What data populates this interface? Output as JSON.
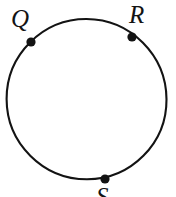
{
  "figure": {
    "type": "geometry-diagram",
    "canvas": {
      "width": 176,
      "height": 197
    },
    "background_color": "#ffffff",
    "stroke_color": "#131313",
    "point_fill_color": "#131313",
    "circle": {
      "name": "circle-outline",
      "center_x": 86.5,
      "center_y": 99,
      "radius": 80,
      "stroke_width": 2.1
    },
    "points": [
      {
        "id": "Q",
        "label": "Q",
        "x": 31,
        "y": 42,
        "radius": 4.6,
        "label_position": "upper-left",
        "clipped": false
      },
      {
        "id": "R",
        "label": "R",
        "x": 132,
        "y": 37,
        "radius": 4.6,
        "label_position": "above-right",
        "clipped": false
      },
      {
        "id": "S",
        "label": "S",
        "x": 105,
        "y": 179,
        "radius": 4.6,
        "label_position": "below",
        "clipped": true
      }
    ]
  }
}
